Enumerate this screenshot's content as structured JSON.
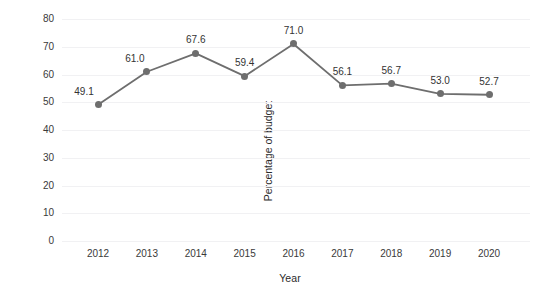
{
  "chart_data": {
    "type": "line",
    "title": "",
    "xlabel": "Year",
    "ylabel": "Percentage of budget",
    "categories": [
      "2012",
      "2013",
      "2014",
      "2015",
      "2016",
      "2017",
      "2018",
      "2019",
      "2020"
    ],
    "values": [
      49.1,
      61.0,
      67.6,
      59.4,
      71.0,
      56.1,
      56.7,
      53.0,
      52.7
    ],
    "point_labels": [
      "49.1",
      "61.0",
      "67.6",
      "59.4",
      "71.0",
      "56.1",
      "56.7",
      "53.0",
      "52.7"
    ],
    "ylim": [
      0,
      80
    ],
    "ytick_labels": [
      "80",
      "70",
      "60",
      "50",
      "40",
      "30",
      "20",
      "10",
      "0"
    ],
    "ytick_values": [
      80,
      70,
      60,
      50,
      40,
      30,
      20,
      10,
      0
    ],
    "grid": "horizontal",
    "legend": "none",
    "series": [
      {
        "name": "Percentage of budget",
        "values": [
          49.1,
          61.0,
          67.6,
          59.4,
          71.0,
          56.1,
          56.7,
          53.0,
          52.7
        ]
      }
    ]
  },
  "style": {
    "line_color": "#6e6e6e",
    "marker_color": "#6e6e6e",
    "grid_color": "#f1f1f3",
    "text_color": "#333333",
    "background": "#ffffff"
  }
}
